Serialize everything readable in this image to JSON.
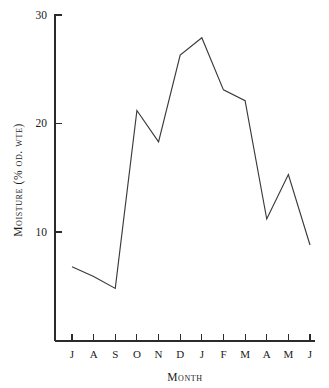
{
  "chart_data": {
    "type": "line",
    "title": "",
    "xlabel": "Month",
    "ylabel": "Moisture (% od. wte)",
    "categories": [
      "J",
      "A",
      "S",
      "O",
      "N",
      "D",
      "J",
      "F",
      "M",
      "A",
      "M",
      "J"
    ],
    "values": [
      6.8,
      5.9,
      4.8,
      21.2,
      18.3,
      26.3,
      27.9,
      23.1,
      22.1,
      11.2,
      15.3,
      8.8
    ],
    "ylim": [
      0,
      30
    ],
    "yticks": [
      10,
      20,
      30
    ],
    "ytick_labels": [
      "10",
      "20",
      "30"
    ],
    "xtick_labels": [
      "J",
      "A",
      "S",
      "O",
      "N",
      "D",
      "J",
      "F",
      "M",
      "A",
      "M",
      "J"
    ],
    "grid": false,
    "legend": null,
    "series": [
      {
        "name": "Moisture",
        "values": [
          6.8,
          5.9,
          4.8,
          21.2,
          18.3,
          26.3,
          27.9,
          23.1,
          22.1,
          11.2,
          15.3,
          8.8
        ]
      }
    ]
  },
  "axes": {
    "y_title": "Moisture (% od. wte)",
    "x_title": "Month"
  },
  "colors": {
    "line": "#3a3a3a",
    "axis": "#2b2b2b",
    "text": "#1a1a1a",
    "background": "#ffffff"
  }
}
